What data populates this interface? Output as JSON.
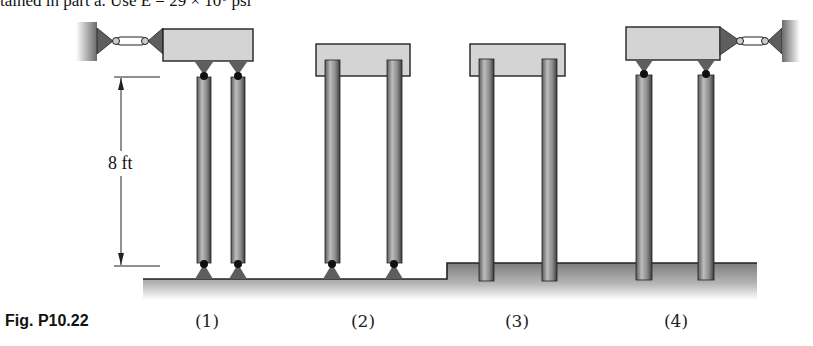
{
  "header": {
    "clipped_text": "tained in part a. Use E = 29 × 10⁶ psi"
  },
  "figure": {
    "caption": "Fig. P10.22",
    "dimension": {
      "label": "8 ft",
      "type": "vertical-arrow"
    },
    "cases": [
      {
        "id": 1,
        "label": "(1)",
        "top": "pinned to braced cap (cable to left wall)",
        "bottom": "pinned"
      },
      {
        "id": 2,
        "label": "(2)",
        "top": "fixed into free cap",
        "bottom": "pinned"
      },
      {
        "id": 3,
        "label": "(3)",
        "top": "fixed into free cap",
        "bottom": "fixed (embedded)"
      },
      {
        "id": 4,
        "label": "(4)",
        "top": "pinned to braced cap (cable to right wall)",
        "bottom": "fixed (embedded)"
      }
    ]
  },
  "colors": {
    "column_dark": "#4a4a4a",
    "column_light": "#b8b8b8",
    "cap_fill": "#d4d4d4",
    "ground_top": "#8a8a8a",
    "ground_bottom": "#ffffff",
    "pin": "#111111",
    "support_triangle": "#5e5e5e",
    "outline": "#222222"
  }
}
